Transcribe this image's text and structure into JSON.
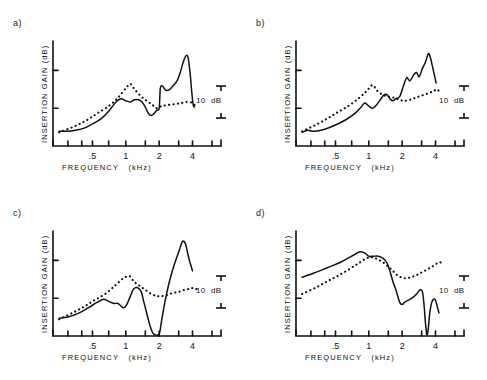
{
  "figure": {
    "title": "",
    "panel_count": 4,
    "axis_labels": {
      "x": "FREQUENCY   (kHz)",
      "y": "INSERTION GAIN  (dB)"
    },
    "x_ticks_labeled": [
      ".5",
      "1",
      "2",
      "4"
    ],
    "x_tick_values": [
      0.5,
      1,
      2,
      4
    ],
    "x_minor_values": [
      0.3,
      0.4,
      0.5,
      0.7,
      1,
      1.5,
      2,
      3,
      4,
      6
    ],
    "scale_bar": {
      "label": "10  dB",
      "value": 10,
      "units": "dB"
    },
    "line_color": "#111111",
    "series_names": [
      "solid",
      "dotted"
    ]
  },
  "chart_data": [
    {
      "type": "line",
      "panel": "a)",
      "title": "",
      "xlabel": "FREQUENCY   (kHz)",
      "ylabel": "INSERTION GAIN  (dB)",
      "xscale": "log",
      "xlim": [
        0.22,
        6.0
      ],
      "ylim": [
        0,
        100
      ],
      "xticks": [
        0.5,
        1,
        2,
        4
      ],
      "xticklabels": [
        ".5",
        "1",
        "2",
        "4"
      ],
      "grid": false,
      "legend": "none",
      "annotations": [
        "10  dB"
      ],
      "series": [
        {
          "name": "solid",
          "style": "solid",
          "x": [
            0.25,
            0.3,
            0.35,
            0.42,
            0.5,
            0.6,
            0.7,
            0.8,
            0.9,
            1.0,
            1.1,
            1.2,
            1.3,
            1.4,
            1.5,
            1.6,
            1.7,
            1.8,
            1.9,
            2.0,
            2.05,
            2.15,
            2.3,
            2.5,
            2.7,
            2.9,
            3.1,
            3.3,
            3.5,
            3.65,
            3.8,
            3.95,
            4.05,
            4.15
          ],
          "values": [
            14,
            14,
            15,
            17,
            21,
            26,
            33,
            41,
            45,
            43,
            42,
            44,
            44,
            42,
            37,
            31,
            29,
            31,
            34,
            36,
            55,
            57,
            53,
            54,
            58,
            62,
            70,
            80,
            86,
            84,
            70,
            50,
            40,
            37
          ]
        },
        {
          "name": "dotted",
          "style": "dotted",
          "x": [
            0.25,
            0.35,
            0.45,
            0.55,
            0.7,
            0.85,
            1.0,
            1.1,
            1.2,
            1.35,
            1.5,
            1.7,
            1.9,
            2.1,
            2.4,
            2.8,
            3.2,
            3.6,
            4.0,
            4.25
          ],
          "values": [
            13,
            19,
            25,
            31,
            38,
            46,
            55,
            59,
            54,
            48,
            44,
            40,
            36,
            38,
            39,
            40,
            41,
            42,
            41,
            38
          ]
        }
      ]
    },
    {
      "type": "line",
      "panel": "b)",
      "title": "",
      "xlabel": "FREQUENCY   (kHz)",
      "ylabel": "INSERTION GAIN  (dB)",
      "xscale": "log",
      "xlim": [
        0.22,
        6.0
      ],
      "ylim": [
        0,
        100
      ],
      "xticks": [
        0.5,
        1,
        2,
        4
      ],
      "xticklabels": [
        ".5",
        "1",
        "2",
        "4"
      ],
      "grid": false,
      "legend": "none",
      "annotations": [
        "10  dB"
      ],
      "series": [
        {
          "name": "solid",
          "style": "solid",
          "x": [
            0.25,
            0.28,
            0.32,
            0.4,
            0.5,
            0.62,
            0.75,
            0.85,
            0.92,
            1.0,
            1.08,
            1.15,
            1.25,
            1.35,
            1.45,
            1.55,
            1.65,
            1.75,
            1.9,
            2.05,
            2.2,
            2.35,
            2.55,
            2.7,
            2.85,
            3.05,
            3.25,
            3.45,
            3.6,
            3.75,
            3.9,
            4.05
          ],
          "values": [
            13,
            15,
            14,
            16,
            20,
            25,
            31,
            37,
            41,
            38,
            36,
            38,
            43,
            48,
            49,
            45,
            43,
            45,
            47,
            57,
            65,
            62,
            68,
            70,
            66,
            74,
            80,
            88,
            84,
            76,
            68,
            60
          ]
        },
        {
          "name": "dotted",
          "style": "dotted",
          "x": [
            0.25,
            0.33,
            0.42,
            0.52,
            0.65,
            0.8,
            0.95,
            1.08,
            1.18,
            1.32,
            1.5,
            1.7,
            1.9,
            2.1,
            2.35,
            2.65,
            3.0,
            3.4,
            3.8,
            4.15,
            4.4
          ],
          "values": [
            14,
            20,
            26,
            32,
            38,
            45,
            52,
            58,
            53,
            49,
            47,
            46,
            44,
            43,
            44,
            46,
            48,
            50,
            52,
            54,
            50
          ]
        }
      ]
    },
    {
      "type": "line",
      "panel": "c)",
      "title": "",
      "xlabel": "FREQUENCY   (kHz)",
      "ylabel": "INSERTION GAIN  (dB)",
      "xscale": "log",
      "xlim": [
        0.22,
        6.0
      ],
      "ylim": [
        0,
        100
      ],
      "xticks": [
        0.5,
        1,
        2,
        4
      ],
      "xticklabels": [
        ".5",
        "1",
        "2",
        "4"
      ],
      "grid": false,
      "legend": "none",
      "annotations": [
        "10  dB"
      ],
      "series": [
        {
          "name": "solid",
          "style": "solid",
          "x": [
            0.25,
            0.3,
            0.38,
            0.46,
            0.55,
            0.63,
            0.7,
            0.78,
            0.85,
            0.95,
            1.02,
            1.1,
            1.18,
            1.28,
            1.38,
            1.45,
            1.55,
            1.65,
            1.75,
            1.85,
            1.95,
            2.02,
            2.1,
            2.25,
            2.45,
            2.7,
            3.0,
            3.25,
            3.45,
            3.6,
            3.75,
            3.9,
            4.0
          ],
          "values": [
            17,
            18,
            22,
            27,
            32,
            35,
            33,
            31,
            31,
            27,
            30,
            38,
            45,
            46,
            42,
            33,
            21,
            10,
            3,
            1,
            1,
            3,
            14,
            32,
            50,
            66,
            80,
            90,
            88,
            80,
            72,
            66,
            62
          ]
        },
        {
          "name": "dotted",
          "style": "dotted",
          "x": [
            0.25,
            0.33,
            0.42,
            0.52,
            0.65,
            0.8,
            0.95,
            1.08,
            1.18,
            1.32,
            1.5,
            1.7,
            1.9,
            2.1,
            2.35,
            2.65,
            3.0,
            3.4,
            3.8,
            4.15,
            4.4
          ],
          "values": [
            16,
            22,
            28,
            34,
            40,
            48,
            55,
            57,
            52,
            48,
            44,
            40,
            38,
            38,
            39,
            41,
            42,
            44,
            45,
            46,
            44
          ]
        }
      ]
    },
    {
      "type": "line",
      "panel": "d)",
      "title": "",
      "xlabel": "FREQUENCY   (kHz)",
      "ylabel": "INSERTION GAIN  (dB)",
      "xscale": "log",
      "xlim": [
        0.22,
        6.0
      ],
      "ylim": [
        0,
        100
      ],
      "xticks": [
        0.5,
        1,
        2,
        4
      ],
      "xticklabels": [
        ".5",
        "1",
        "2",
        "4"
      ],
      "grid": false,
      "legend": "none",
      "annotations": [
        "10  dB"
      ],
      "series": [
        {
          "name": "solid",
          "style": "solid",
          "x": [
            0.25,
            0.32,
            0.42,
            0.55,
            0.7,
            0.82,
            0.92,
            1.0,
            1.1,
            1.22,
            1.35,
            1.45,
            1.55,
            1.65,
            1.78,
            1.9,
            2.0,
            2.1,
            2.25,
            2.45,
            2.7,
            2.9,
            3.05,
            3.15,
            3.25,
            3.35,
            3.45,
            3.55,
            3.7,
            3.85,
            4.0,
            4.15,
            4.3
          ],
          "values": [
            56,
            60,
            65,
            70,
            76,
            80,
            79,
            76,
            76,
            76,
            74,
            70,
            62,
            52,
            42,
            32,
            30,
            32,
            34,
            36,
            40,
            44,
            42,
            30,
            12,
            1,
            8,
            22,
            32,
            35,
            34,
            28,
            22
          ]
        },
        {
          "name": "dotted",
          "style": "dotted",
          "x": [
            0.25,
            0.33,
            0.42,
            0.52,
            0.65,
            0.8,
            0.95,
            1.08,
            1.2,
            1.35,
            1.5,
            1.65,
            1.8,
            1.95,
            2.15,
            2.4,
            2.7,
            3.05,
            3.45,
            3.85,
            4.25,
            4.5
          ],
          "values": [
            40,
            46,
            52,
            57,
            63,
            69,
            74,
            75,
            73,
            70,
            66,
            62,
            58,
            56,
            55,
            56,
            58,
            61,
            64,
            67,
            70,
            70
          ]
        }
      ]
    }
  ],
  "panels": [
    {
      "label": "a)",
      "scale_label": "10  dB"
    },
    {
      "label": "b)",
      "scale_label": "10  dB"
    },
    {
      "label": "c)",
      "scale_label": "10  dB"
    },
    {
      "label": "d)",
      "scale_label": "10  dB"
    }
  ]
}
